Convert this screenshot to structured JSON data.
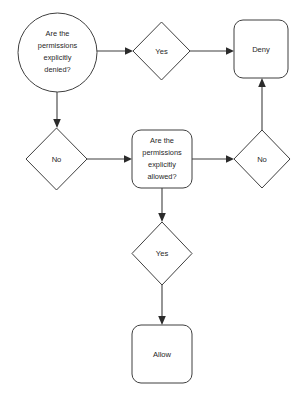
{
  "diagram": {
    "background_color": "#ffffff",
    "stroke_color": "#3f3f3f",
    "text_color": "#1f1f1f"
  },
  "nodes": {
    "start_question": {
      "shape": "ellipse",
      "lines": [
        "Are the",
        "permissions",
        "explicitly",
        "denied?"
      ],
      "text": "Are the permissions explicitly denied?"
    },
    "denied_yes": {
      "shape": "diamond",
      "text": "Yes"
    },
    "denied_no": {
      "shape": "diamond",
      "text": "No"
    },
    "deny_terminal": {
      "shape": "rounded-rectangle",
      "text": "Deny"
    },
    "allowed_question": {
      "shape": "rounded-rectangle",
      "lines": [
        "Are the",
        "permissions",
        "explicitly",
        "allowed?"
      ],
      "text": "Are the permissions explicitly allowed?"
    },
    "allowed_no": {
      "shape": "diamond",
      "text": "No"
    },
    "allowed_yes": {
      "shape": "diamond",
      "text": "Yes"
    },
    "allow_terminal": {
      "shape": "rounded-rectangle",
      "text": "Allow"
    }
  },
  "edges": [
    {
      "name": "start-to-denied-yes",
      "from": "start_question",
      "to": "denied_yes",
      "direction": "right"
    },
    {
      "name": "denied-yes-to-deny",
      "from": "denied_yes",
      "to": "deny_terminal",
      "direction": "right"
    },
    {
      "name": "start-to-denied-no",
      "from": "start_question",
      "to": "denied_no",
      "direction": "down"
    },
    {
      "name": "denied-no-to-allowed-question",
      "from": "denied_no",
      "to": "allowed_question",
      "direction": "right"
    },
    {
      "name": "allowed-question-to-allowed-no",
      "from": "allowed_question",
      "to": "allowed_no",
      "direction": "right"
    },
    {
      "name": "allowed-no-to-deny",
      "from": "allowed_no",
      "to": "deny_terminal",
      "direction": "up"
    },
    {
      "name": "allowed-question-to-allowed-yes",
      "from": "allowed_question",
      "to": "allowed_yes",
      "direction": "down"
    },
    {
      "name": "allowed-yes-to-allow",
      "from": "allowed_yes",
      "to": "allow_terminal",
      "direction": "down"
    }
  ]
}
